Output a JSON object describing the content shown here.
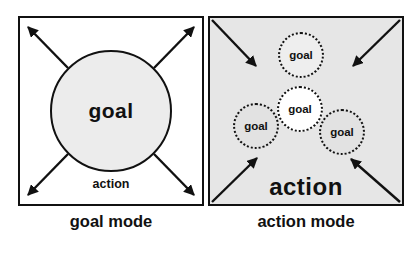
{
  "diagram": {
    "left_panel": {
      "circle_label": "goal",
      "action_label": "action",
      "caption": "goal mode",
      "arrow_direction": "outward"
    },
    "right_panel": {
      "circles": [
        {
          "position": "top",
          "label": "goal"
        },
        {
          "position": "center",
          "label": "goal"
        },
        {
          "position": "left",
          "label": "goal"
        },
        {
          "position": "right",
          "label": "goal"
        }
      ],
      "action_label": "action",
      "caption": "action mode",
      "arrow_direction": "inward"
    },
    "colors": {
      "panel_border": "#111111",
      "arrow_color": "#111111",
      "left_circle_fill": "#ececec",
      "right_panel_bg": "#e6e6e6",
      "top_circle_fill": "#eeeeee",
      "center_circle_fill": "#ffffff",
      "side_circle_fill": "#e2e2e2"
    }
  }
}
